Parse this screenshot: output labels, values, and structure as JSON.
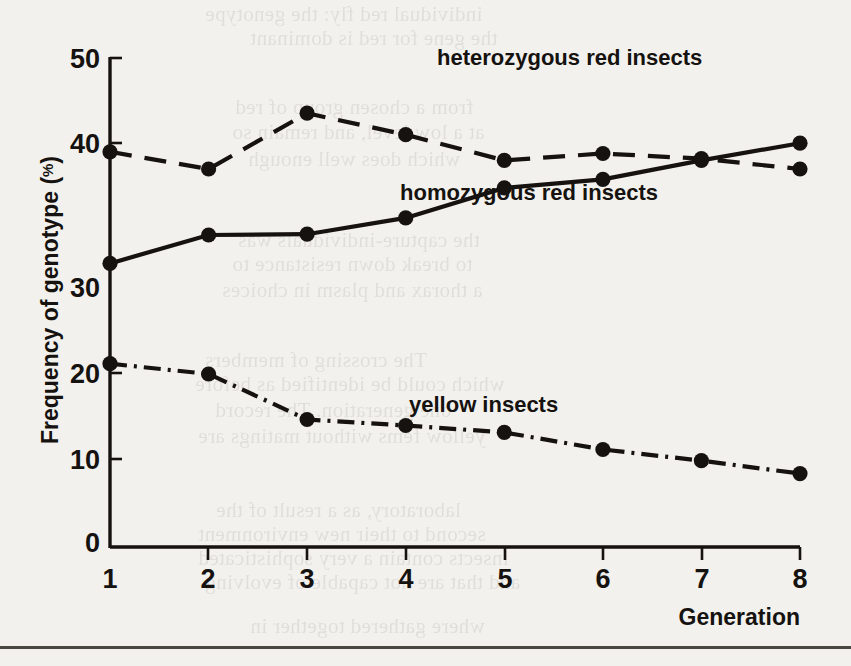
{
  "figure": {
    "background_color": "#f2f1ee",
    "ink_color": "#15120f",
    "bottom_rule": true
  },
  "axes": {
    "y_title": "Frequency of genotype (",
    "y_title_percent": "%",
    "y_title_close": ")",
    "x_title": "Generation",
    "y_ticks": [
      "0",
      "10",
      "20",
      "30",
      "40",
      "50"
    ],
    "x_ticks": [
      "1",
      "2",
      "3",
      "4",
      "5",
      "6",
      "7",
      "8"
    ]
  },
  "labels": {
    "heterozygous": "heterozygous  red insects",
    "homozygous": "homozygous red insects",
    "yellow": "yellow insects"
  },
  "chart_data": {
    "type": "line",
    "title": "",
    "xlabel": "Generation",
    "ylabel": "Frequency of genotype (%)",
    "xlim": [
      1,
      8
    ],
    "ylim": [
      0,
      52
    ],
    "x": [
      1,
      2,
      3,
      4,
      5,
      6,
      7,
      8
    ],
    "xtick_labels": [
      "1",
      "2",
      "3",
      "4",
      "5",
      "6",
      "7",
      "8"
    ],
    "ytick_labels": [
      "0",
      "10",
      "20",
      "30",
      "40",
      "50"
    ],
    "ytick_values": [
      0,
      10,
      20,
      30,
      40,
      50
    ],
    "grid": false,
    "legend": "inline-annotations",
    "series": [
      {
        "name": "heterozygous red insects",
        "style": "dashed",
        "marker": "filled-circle",
        "values": [
          46.0,
          44.0,
          50.5,
          48.0,
          45.0,
          45.8,
          45.2,
          44.0
        ]
      },
      {
        "name": "homozygous red insects",
        "style": "solid",
        "marker": "filled-circle",
        "values": [
          33.0,
          36.3,
          36.4,
          38.3,
          41.8,
          42.8,
          45.0,
          47.0
        ]
      },
      {
        "name": "yellow insects",
        "style": "dash-dot",
        "marker": "filled-circle",
        "values": [
          21.3,
          20.1,
          14.8,
          14.1,
          13.3,
          11.3,
          10.0,
          8.5
        ]
      }
    ]
  },
  "bleed_text": [
    {
      "t": "individual red fly: the genotype",
      "x": 205,
      "y": 2
    },
    {
      "t": "the gene for red is dominant",
      "x": 250,
      "y": 26
    },
    {
      "t": "from a chosen group of red",
      "x": 235,
      "y": 95
    },
    {
      "t": "at a low level, and remain so",
      "x": 232,
      "y": 120
    },
    {
      "t": "which does well enough",
      "x": 248,
      "y": 147
    },
    {
      "t": "the capture-individuals was",
      "x": 238,
      "y": 228
    },
    {
      "t": "to break down resistance to",
      "x": 232,
      "y": 252
    },
    {
      "t": "a thorax and plasm in choices",
      "x": 222,
      "y": 278
    },
    {
      "t": "The crossing of members",
      "x": 205,
      "y": 348
    },
    {
      "t": "which could be identified as before",
      "x": 195,
      "y": 372
    },
    {
      "t": "one generation. The record",
      "x": 215,
      "y": 398
    },
    {
      "t": "yellow fems without matings are",
      "x": 198,
      "y": 424
    },
    {
      "t": "laboratory, as a result of the",
      "x": 216,
      "y": 498
    },
    {
      "t": "second to their new environment",
      "x": 198,
      "y": 522
    },
    {
      "t": "insects contain a very sophisticated",
      "x": 198,
      "y": 546
    },
    {
      "t": "and that are not capable of evolving",
      "x": 205,
      "y": 570
    },
    {
      "t": "where gathered together in",
      "x": 250,
      "y": 614
    }
  ]
}
